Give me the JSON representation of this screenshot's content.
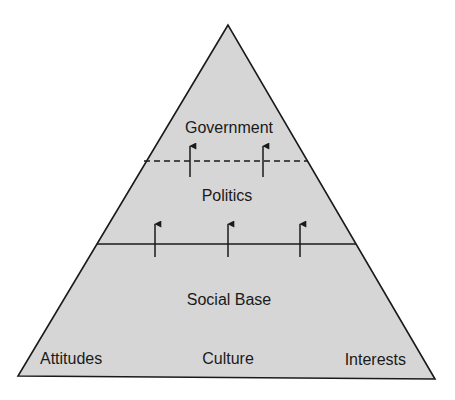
{
  "diagram": {
    "type": "pyramid",
    "colors": {
      "background": "#ffffff",
      "fill": "#d6d6d6",
      "stroke": "#1a1a1a",
      "text": "#1a1a1a"
    },
    "geometry": {
      "apex": [
        228,
        25
      ],
      "base_left": [
        18,
        376
      ],
      "base_right": [
        435,
        379
      ]
    },
    "layers": [
      {
        "id": "government",
        "label": "Government"
      },
      {
        "id": "politics",
        "label": "Politics"
      },
      {
        "id": "social-base",
        "label": "Social Base"
      }
    ],
    "dividers": [
      {
        "id": "government-politics",
        "style": "dashed",
        "y": 161,
        "x1": 144,
        "x2": 308
      },
      {
        "id": "politics-social-base",
        "style": "solid",
        "y": 244,
        "x1": 97,
        "x2": 356
      }
    ],
    "arrows": [
      {
        "group": "politics-to-government",
        "x": 190,
        "y_from": 177,
        "y_to": 144
      },
      {
        "group": "politics-to-government",
        "x": 263,
        "y_from": 177,
        "y_to": 144
      },
      {
        "group": "social-base-to-politics",
        "x": 155,
        "y_from": 257,
        "y_to": 222
      },
      {
        "group": "social-base-to-politics",
        "x": 228,
        "y_from": 257,
        "y_to": 222
      },
      {
        "group": "social-base-to-politics",
        "x": 300,
        "y_from": 257,
        "y_to": 222
      }
    ],
    "base_components": [
      {
        "id": "attitudes",
        "label": "Attitudes"
      },
      {
        "id": "culture",
        "label": "Culture"
      },
      {
        "id": "interests",
        "label": "Interests"
      }
    ]
  }
}
